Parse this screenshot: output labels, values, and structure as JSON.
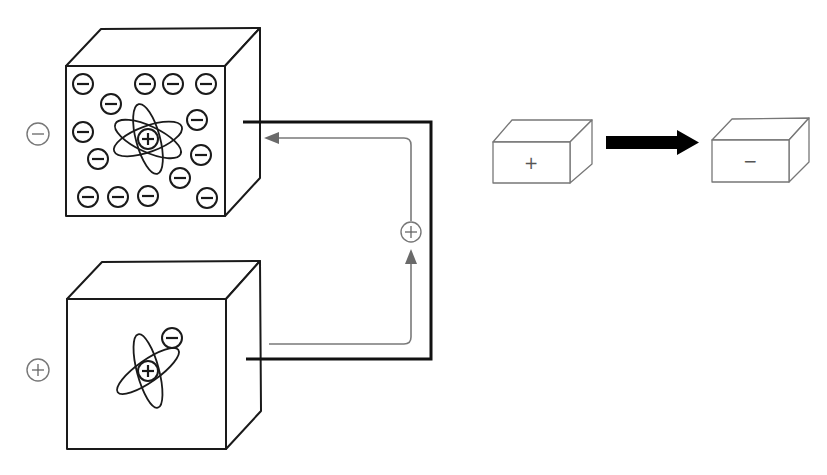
{
  "diagram": {
    "colors": {
      "line": "#1a1a1a",
      "wire": "#111111",
      "flow": "#7a7a7a",
      "box_outline": "#777777",
      "background": "#ffffff"
    },
    "top_object": {
      "charge_label": "−",
      "charge_type": "negative",
      "nucleus_label": "+",
      "electron_label": "−",
      "electron_count": 14
    },
    "bottom_object": {
      "charge_label": "+",
      "charge_type": "positive",
      "nucleus_label": "+",
      "electron_label": "−",
      "electron_count": 1
    },
    "circuit": {
      "flow_charge_label": "+",
      "flow_direction": "from bottom object up to top object"
    },
    "transfer": {
      "source_box_label": "+",
      "target_box_label": "−",
      "arrow": "right-arrow"
    }
  }
}
